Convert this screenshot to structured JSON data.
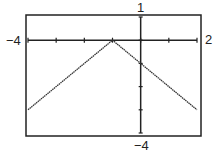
{
  "chart_data": {
    "type": "line",
    "title": "",
    "xlabel": "",
    "ylabel": "",
    "xlim": [
      -4,
      2
    ],
    "ylim": [
      -4,
      1
    ],
    "x_ticks": [
      -4,
      -3,
      -2,
      -1,
      0,
      1,
      2
    ],
    "y_ticks": [
      -4,
      -3,
      -2,
      -1,
      0,
      1
    ],
    "grid": false,
    "series": [
      {
        "name": "y = -|x + 1|",
        "x": [
          -4,
          -3,
          -2,
          -1,
          0,
          1,
          2
        ],
        "y": [
          -3,
          -2,
          -1,
          0,
          -1,
          -2,
          -3
        ]
      }
    ],
    "axis_labels": {
      "x_min": "−4",
      "x_max": "2",
      "y_max": "1",
      "y_min": "−4"
    }
  }
}
